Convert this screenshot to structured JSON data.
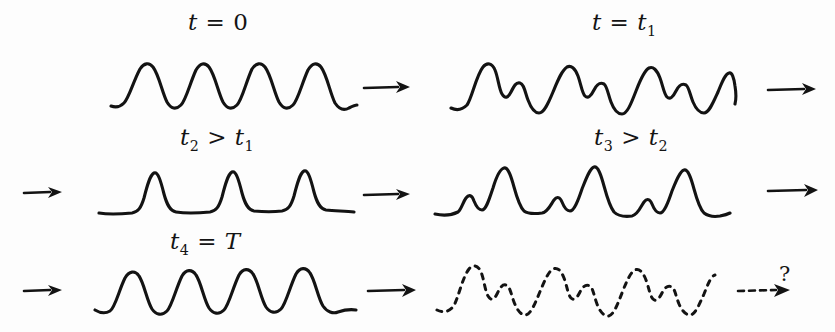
{
  "figure": {
    "caption_present": false,
    "background_color": "#fdfdfd",
    "ink_color": "#131313"
  },
  "panels": [
    {
      "id": "panel-t0",
      "label": "t = 0",
      "label_parts": {
        "var": "t",
        "rel": "=",
        "value": "0"
      },
      "line_style": "solid",
      "shape": "smooth-sinusoid",
      "cycles": 4
    },
    {
      "id": "panel-t1",
      "label": "t = t1",
      "label_parts": {
        "var": "t",
        "rel": "=",
        "value": "t",
        "sub": "1"
      },
      "line_style": "solid",
      "shape": "steepened-with-secondary-bumps",
      "cycles": 4
    },
    {
      "id": "panel-t2",
      "label": "t2 > t1",
      "label_parts": {
        "var": "t",
        "sub": "2",
        "rel": ">",
        "value": "t",
        "value_sub": "1"
      },
      "line_style": "solid",
      "shape": "sharp-narrow-spikes",
      "cycles": 4
    },
    {
      "id": "panel-t3",
      "label": "t3 > t2",
      "label_parts": {
        "var": "t",
        "sub": "3",
        "rel": ">",
        "value": "t",
        "value_sub": "2"
      },
      "line_style": "solid",
      "shape": "peaks-with-leading-bumps",
      "cycles": 4
    },
    {
      "id": "panel-t4",
      "label": "t4 = T",
      "label_parts": {
        "var": "t",
        "sub": "4",
        "rel": "=",
        "value": "T"
      },
      "line_style": "solid",
      "shape": "recurrence-smooth-sinusoid",
      "cycles": 4
    },
    {
      "id": "panel-future",
      "label": "",
      "line_style": "dashed",
      "shape": "uncertain-repeat-of-t1",
      "cycles": 4
    }
  ],
  "arrows": [
    {
      "id": "arrow-row1-mid",
      "style": "solid",
      "direction": "right"
    },
    {
      "id": "arrow-row1-end",
      "style": "solid",
      "direction": "right"
    },
    {
      "id": "arrow-row2-start",
      "style": "solid",
      "direction": "right"
    },
    {
      "id": "arrow-row2-mid",
      "style": "solid",
      "direction": "right"
    },
    {
      "id": "arrow-row2-end",
      "style": "solid",
      "direction": "right"
    },
    {
      "id": "arrow-row3-start",
      "style": "solid",
      "direction": "right"
    },
    {
      "id": "arrow-row3-mid",
      "style": "solid",
      "direction": "right"
    },
    {
      "id": "arrow-row3-end",
      "style": "dashed",
      "direction": "right"
    }
  ],
  "annotations": {
    "question_mark": "?"
  }
}
